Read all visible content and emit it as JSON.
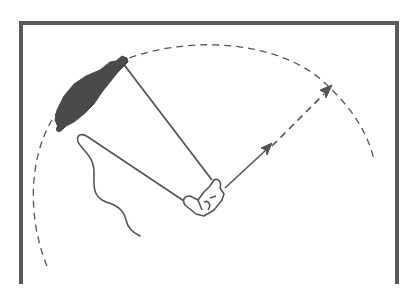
{
  "figure": {
    "title": "Casting arc illustration",
    "colors": {
      "stroke": "#555555",
      "frame": "#5a5a5a",
      "fill_dark": "#4a4a4a",
      "background": "#ffffff"
    },
    "elements": {
      "frame": "open-bottom rectangular frame",
      "arc": "dashed circular swing path",
      "rod": "straight rod from hand to tip",
      "lure": "dark elongated lure at rod tip",
      "hand": "outlined hand gripping the rod",
      "line": "line looping back from hand with trailing squiggle",
      "direction_arrow": "arrow from hand toward arc (solid then dashed)"
    }
  }
}
